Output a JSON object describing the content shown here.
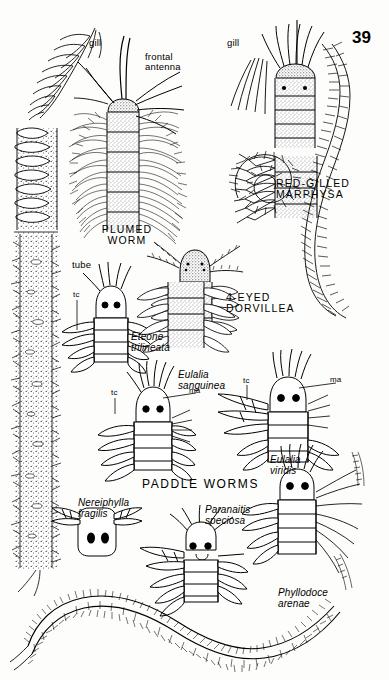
{
  "page": {
    "number": "39",
    "background_color": "#fdfdfb",
    "ink_color": "#000000",
    "width": 389,
    "height": 680
  },
  "headings": {
    "plumed_worm": "PLUMED\nWORM",
    "red_gilled_marphysa": "RED-GILLED\nMARPHYSA",
    "four_eyed_dorvillea": "4-EYED\nDORVILLEA",
    "paddle_worms": "PADDLE WORMS"
  },
  "species": {
    "eteone": "Eteone\ntrilineata",
    "eulalia_sanguinea": "Eulalia\nsanguinea",
    "eulalia_viridis": "Eulalia\nviridis",
    "nereiphylla": "Nereiphylla\nfragilis",
    "paranaitis": "Paranaitis\nspeciosa",
    "phyllodoce": "Phyllodoce\narenae"
  },
  "callouts": {
    "gill_left": "gill",
    "gill_right": "gill",
    "frontal_antenna": "frontal\nantenna",
    "tube": "tube",
    "tc_eteone": "tc",
    "tc_sanguinea": "tc",
    "ma_sanguinea": "ma",
    "tc_viridis": "tc",
    "ma_viridis": "ma"
  },
  "figures": [
    {
      "name": "gill-feather-detail",
      "kind": "pinnate-gill"
    },
    {
      "name": "worm-tube-column",
      "kind": "stippled-tube"
    },
    {
      "name": "plumed-worm-head",
      "kind": "segmented-bristled-head"
    },
    {
      "name": "marphysa-head",
      "kind": "segmented-head-with-gills"
    },
    {
      "name": "marphysa-coiled-body",
      "kind": "coiled-segmented-worm"
    },
    {
      "name": "marphysa-curved-body",
      "kind": "curved-segmented-worm"
    },
    {
      "name": "dorvillea-head",
      "kind": "four-eyed-head"
    },
    {
      "name": "eteone-head",
      "kind": "paddle-worm-head"
    },
    {
      "name": "eulalia-sanguinea-head",
      "kind": "paddle-worm-head"
    },
    {
      "name": "eulalia-sanguinea-body-segment",
      "kind": "segmented-body"
    },
    {
      "name": "eulalia-viridis-head",
      "kind": "paddle-worm-head"
    },
    {
      "name": "nereiphylla-head",
      "kind": "simple-square-head"
    },
    {
      "name": "paranaitis-head",
      "kind": "paddle-worm-head"
    },
    {
      "name": "phyllodoce-head",
      "kind": "paddle-worm-head"
    },
    {
      "name": "phyllodoce-whole-worm",
      "kind": "long-sinuous-worm"
    }
  ]
}
